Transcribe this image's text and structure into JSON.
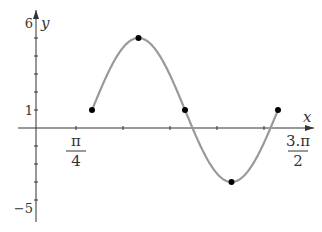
{
  "chart_data": {
    "type": "line",
    "title": "",
    "xlabel": "x",
    "ylabel": "y",
    "function": "y = 1 + 4 sin(...)",
    "x_tick_labels": [
      {
        "num": "π",
        "den": "4",
        "value": 0.25
      },
      {
        "num": "3.π",
        "den": "2",
        "value": 1.5
      }
    ],
    "x_ticks_in_pi": [
      0.25,
      0.5,
      0.75,
      1.0,
      1.25
    ],
    "y_tick_labels": [
      {
        "text": "6",
        "value": 6
      },
      {
        "text": "1",
        "value": 1
      },
      {
        "text": "−5",
        "value": -5
      }
    ],
    "y_ticks": [
      5,
      4,
      3,
      2,
      1,
      -1,
      -2,
      -3,
      -4
    ],
    "ylim": [
      -5,
      6
    ],
    "midline": 1,
    "amplitude": 4,
    "points": [
      {
        "x_px_frac": 0,
        "y": 1
      },
      {
        "x_px_frac": 0.25,
        "y": 5
      },
      {
        "x_px_frac": 0.5,
        "y": 1
      },
      {
        "x_px_frac": 0.75,
        "y": -3
      },
      {
        "x_px_frac": 1.0,
        "y": 1
      }
    ],
    "series_color": "#999999",
    "grid": false
  }
}
